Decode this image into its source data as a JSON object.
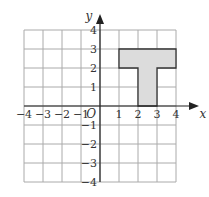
{
  "diagram": {
    "type": "coordinate-grid",
    "x_axis": {
      "label": "x",
      "min": -4,
      "max": 4,
      "ticks": [
        "−4",
        "−3",
        "−2",
        "−1",
        "1",
        "2",
        "3",
        "4"
      ]
    },
    "y_axis": {
      "label": "y",
      "min": -4,
      "max": 4,
      "ticks": [
        "4",
        "3",
        "2",
        "1",
        "−1",
        "−2",
        "−3",
        "−4"
      ]
    },
    "origin_label": "O",
    "shape": {
      "name": "T-shape",
      "fill": "#dcdcdc",
      "stroke": "#333333",
      "vertices": [
        [
          1,
          3
        ],
        [
          4,
          3
        ],
        [
          4,
          2
        ],
        [
          3,
          2
        ],
        [
          3,
          0
        ],
        [
          2,
          0
        ],
        [
          2,
          2
        ],
        [
          1,
          2
        ]
      ]
    },
    "colors": {
      "grid": "#aaaaaa",
      "axis": "#222222"
    }
  }
}
